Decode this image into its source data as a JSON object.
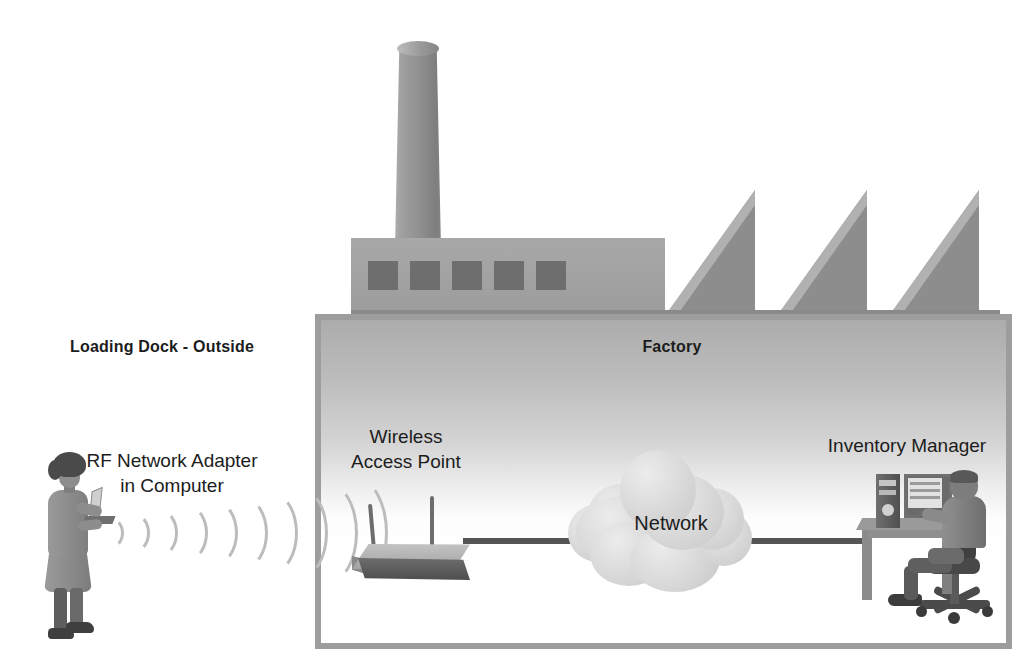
{
  "diagram": {
    "type": "network-topology"
  },
  "labels": {
    "loading_dock": "Loading Dock - Outside",
    "factory": "Factory",
    "rf_adapter": "RF Network Adapter\nin Computer",
    "wireless_access_point": "Wireless\nAccess Point",
    "network": "Network",
    "inventory_manager": "Inventory Manager"
  },
  "nodes": [
    {
      "id": "worker-laptop",
      "label": "RF Network Adapter\nin Computer",
      "zone": "outside",
      "icon": "woman-with-laptop"
    },
    {
      "id": "access-point",
      "label": "Wireless\nAccess Point",
      "zone": "factory",
      "icon": "wireless-router"
    },
    {
      "id": "network-cloud",
      "label": "Network",
      "zone": "factory",
      "icon": "network-cloud"
    },
    {
      "id": "inventory-manager",
      "label": "Inventory Manager",
      "zone": "factory",
      "icon": "seated-man-at-desk"
    }
  ],
  "links": [
    {
      "from": "worker-laptop",
      "to": "access-point",
      "medium": "wireless"
    },
    {
      "from": "access-point",
      "to": "network-cloud",
      "medium": "wired"
    },
    {
      "from": "network-cloud",
      "to": "inventory-manager",
      "medium": "wired"
    }
  ],
  "zones": [
    {
      "id": "outside",
      "label": "Loading Dock - Outside"
    },
    {
      "id": "factory",
      "label": "Factory"
    }
  ],
  "building": {
    "icon": "factory-building",
    "smokestack_count": 1,
    "window_count": 5,
    "sawtooth_roof_count": 3
  },
  "colors": {
    "background": "#ffffff",
    "text": "#1c1c1c",
    "box_border": "#9d9d9d",
    "building": "#9c9c9c",
    "window": "#6e6e6e",
    "wire": "#555555",
    "cloud": "#d2d2d2",
    "wave": "#bcbcbc"
  }
}
